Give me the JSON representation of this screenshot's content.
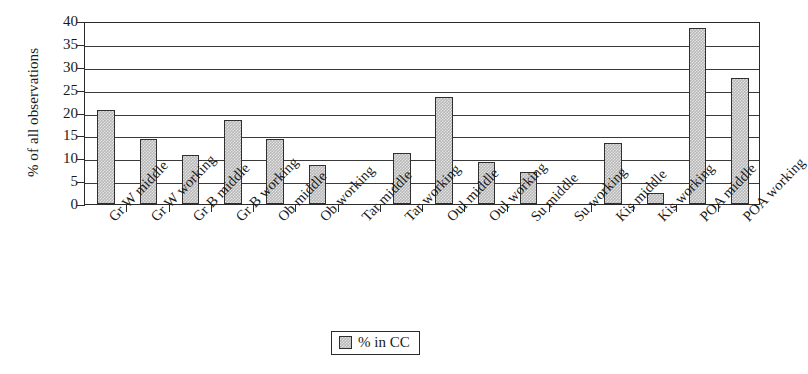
{
  "chart_data": {
    "type": "bar",
    "title": "",
    "subtitle": "",
    "xlabel": "",
    "ylabel": "% of all observations",
    "ylim": [
      0,
      40
    ],
    "ytick_step": 5,
    "yticks": [
      40,
      35,
      30,
      25,
      20,
      15,
      10,
      5,
      0
    ],
    "grid": true,
    "grid_axis": "y",
    "legend_position": "bottom-center",
    "categories": [
      "Gr W middle",
      "Gr W working",
      "Gr B middle",
      "Gr B working",
      "Ob middle",
      "Ob working",
      "Tar middle",
      "Tar working",
      "Oul middle",
      "Oul working",
      "Su middle",
      "Su working",
      "Kis middle",
      "Kis working",
      "POA middle",
      "POA working"
    ],
    "series": [
      {
        "name": "% in CC",
        "color": "#b9b9b9",
        "values": [
          20.5,
          14.3,
          10.7,
          18.3,
          14.3,
          8.6,
          0,
          11.1,
          23.5,
          9.2,
          7.0,
          0,
          13.3,
          2.5,
          38.5,
          27.5
        ]
      }
    ]
  },
  "legend": {
    "entries": [
      {
        "label": "% in CC",
        "swatch": "legend-swatch-gray"
      }
    ]
  },
  "axes": {
    "y_title": "% of all observations"
  }
}
